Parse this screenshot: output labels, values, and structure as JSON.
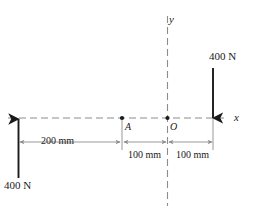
{
  "figure": {
    "axes": {
      "x_label": "x",
      "y_label": "y"
    },
    "points": [
      {
        "name": "A",
        "label": "A"
      },
      {
        "name": "O",
        "label": "O"
      }
    ],
    "forces": [
      {
        "name": "left-force",
        "label": "400 N",
        "direction": "up"
      },
      {
        "name": "right-force",
        "label": "400 N",
        "direction": "down"
      }
    ],
    "dimensions": [
      {
        "name": "dimension-200",
        "label": "200 mm"
      },
      {
        "name": "dimension-100-left",
        "label": "100 mm"
      },
      {
        "name": "dimension-100-right",
        "label": "100 mm"
      }
    ],
    "colors": {
      "line": "#1a1a1a",
      "dashed_axis": "#8c8c8c",
      "dimension": "#8c8c8c",
      "background": "#ffffff"
    }
  }
}
